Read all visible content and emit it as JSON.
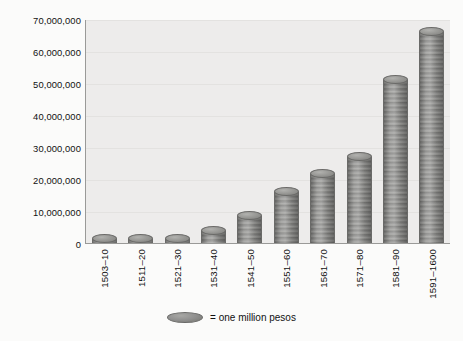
{
  "chart_data": {
    "type": "bar",
    "title": "",
    "subtitle": "",
    "xlabel": "",
    "ylabel": "",
    "categories": [
      "1503–10",
      "1511–20",
      "1521–30",
      "1531–40",
      "1541–50",
      "1551–60",
      "1561–70",
      "1571–80",
      "1581–90",
      "1591–1600"
    ],
    "values": [
      1500000,
      1200000,
      1100000,
      4200000,
      8600000,
      16200000,
      21900000,
      27100000,
      51400000,
      66300000
    ],
    "ylim": [
      0,
      70000000
    ],
    "ytick_values": [
      0,
      10000000,
      20000000,
      30000000,
      40000000,
      50000000,
      60000000,
      70000000
    ],
    "ytick_labels": [
      "0",
      "10,000,000",
      "20,000,000",
      "30,000,000",
      "40,000,000",
      "50,000,000",
      "60,000,000",
      "70,000,000"
    ],
    "grid": true,
    "legend_position": "bottom-center",
    "legend": [
      {
        "marker": "coin-ellipse",
        "label": "= one million pesos"
      }
    ],
    "marker_style": "stacked-coins",
    "annotations": []
  },
  "legend": {
    "coin_icon_name": "coin-icon",
    "text": "= one million pesos"
  },
  "colors": {
    "plot_background": "#edeceb",
    "page_background": "#fbfbfa",
    "coin_fill": "#8e8e8c",
    "coin_edge": "#6a6a68",
    "gridline": "#e3e2e0",
    "axis": "#9a9a98",
    "text": "#111111"
  }
}
